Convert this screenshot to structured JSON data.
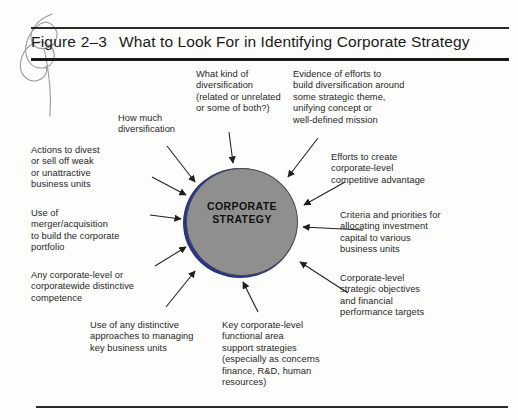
{
  "header": {
    "figure_label": "Figure 2–3",
    "title": "What to Look For in Identifying Corporate Strategy"
  },
  "center": {
    "line1": "CORPORATE",
    "line2": "STRATEGY",
    "fill_color": "#8f8f8f",
    "edge_color": "#27348b"
  },
  "callouts": [
    {
      "name": "how-much-diversification",
      "text": "How much\ndiversification"
    },
    {
      "name": "what-kind-of-diversification",
      "text": "What kind of\ndiversification\n(related or unrelated\nor some of both?)"
    },
    {
      "name": "evidence-of-efforts",
      "text": "Evidence of efforts to\nbuild diversification around\nsome strategic theme,\nunifying concept or\nwell-defined mission"
    },
    {
      "name": "actions-to-divest",
      "text": "Actions to divest\nor sell off weak\nor unattractive\nbusiness units"
    },
    {
      "name": "use-of-merger-acquisition",
      "text": "Use of\nmerger/acquisition\nto build the corporate\nportfolio"
    },
    {
      "name": "any-corporate-level-competence",
      "text": "Any corporate-level or\ncorporatewide distinctive\ncompetence"
    },
    {
      "name": "use-of-distinctive-approaches",
      "text": "Use of any distinctive\napproaches to managing\nkey business units"
    },
    {
      "name": "key-functional-area-strategies",
      "text": "Key corporate-level\nfunctional area\nsupport strategies\n(especially as concerns\nfinance, R&D, human\nresources)"
    },
    {
      "name": "corporate-level-objectives",
      "text": "Corporate-level\nstrategic objectives\nand financial\nperformance targets"
    },
    {
      "name": "criteria-and-priorities",
      "text": "Criteria and priorities for\nallocating investment\ncapital to various\nbusiness units"
    },
    {
      "name": "efforts-to-create-advantage",
      "text": "Efforts to create\ncorporate-level\ncompetitive advantage"
    }
  ],
  "diagram": {
    "type": "radial-callout",
    "arrow_count": 11,
    "arrow_direction": "inward"
  }
}
